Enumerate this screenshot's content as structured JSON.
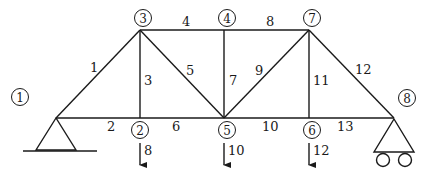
{
  "diagram": {
    "type": "plane-truss",
    "nodes": [
      {
        "id": "1",
        "label": "1",
        "x": 56,
        "y": 118,
        "label_x": 20,
        "label_y": 97
      },
      {
        "id": "2",
        "label": "2",
        "x": 140,
        "y": 118,
        "label_x": 140,
        "label_y": 130
      },
      {
        "id": "3",
        "label": "3",
        "x": 140,
        "y": 30,
        "label_x": 143,
        "label_y": 18
      },
      {
        "id": "4",
        "label": "4",
        "x": 224,
        "y": 30,
        "label_x": 227,
        "label_y": 18
      },
      {
        "id": "5",
        "label": "5",
        "x": 224,
        "y": 118,
        "label_x": 227,
        "label_y": 130
      },
      {
        "id": "6",
        "label": "6",
        "x": 309,
        "y": 118,
        "label_x": 312,
        "label_y": 130
      },
      {
        "id": "7",
        "label": "7",
        "x": 309,
        "y": 30,
        "label_x": 312,
        "label_y": 18
      },
      {
        "id": "8",
        "label": "8",
        "x": 394,
        "y": 118,
        "label_x": 407,
        "label_y": 98
      }
    ],
    "members": [
      {
        "id": "1",
        "label": "1",
        "from": "1",
        "to": "3",
        "lx": 90,
        "ly": 72
      },
      {
        "id": "2",
        "label": "2",
        "from": "1",
        "to": "2",
        "lx": 107,
        "ly": 131
      },
      {
        "id": "3",
        "label": "3",
        "from": "2",
        "to": "3",
        "lx": 144,
        "ly": 85
      },
      {
        "id": "4",
        "label": "4",
        "from": "3",
        "to": "4",
        "lx": 182,
        "ly": 26
      },
      {
        "id": "5",
        "label": "5",
        "from": "3",
        "to": "5",
        "lx": 186,
        "ly": 75
      },
      {
        "id": "6",
        "label": "6",
        "from": "2",
        "to": "5",
        "lx": 172,
        "ly": 131
      },
      {
        "id": "7",
        "label": "7",
        "from": "4",
        "to": "5",
        "lx": 229,
        "ly": 85
      },
      {
        "id": "8",
        "label": "8",
        "from": "4",
        "to": "7",
        "lx": 266,
        "ly": 26
      },
      {
        "id": "9",
        "label": "9",
        "from": "5",
        "to": "7",
        "lx": 255,
        "ly": 75
      },
      {
        "id": "10",
        "label": "10",
        "from": "5",
        "to": "6",
        "lx": 262,
        "ly": 131
      },
      {
        "id": "11",
        "label": "11",
        "from": "6",
        "to": "7",
        "lx": 313,
        "ly": 85
      },
      {
        "id": "12",
        "label": "12",
        "from": "7",
        "to": "8",
        "lx": 355,
        "ly": 74
      },
      {
        "id": "13",
        "label": "13",
        "from": "6",
        "to": "8",
        "lx": 337,
        "ly": 131
      }
    ],
    "loads": [
      {
        "node": "2",
        "label": "8",
        "x": 140,
        "y1": 143,
        "y2": 165,
        "lx": 144,
        "ly": 155
      },
      {
        "node": "5",
        "label": "10",
        "x": 224,
        "y1": 143,
        "y2": 165,
        "lx": 228,
        "ly": 155
      },
      {
        "node": "6",
        "label": "12",
        "x": 309,
        "y1": 143,
        "y2": 165,
        "lx": 313,
        "ly": 155
      }
    ],
    "supports": [
      {
        "node": "1",
        "type": "pin"
      },
      {
        "node": "8",
        "type": "roller"
      }
    ]
  }
}
